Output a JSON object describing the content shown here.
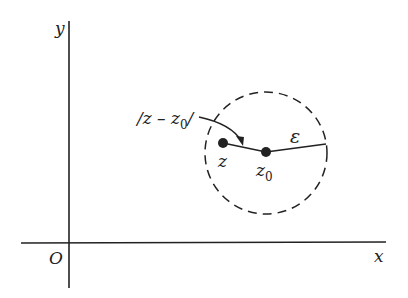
{
  "diagram": {
    "axes": {
      "x_label": "x",
      "y_label": "y",
      "origin_label": "O"
    },
    "points": [
      {
        "id": "z",
        "label": "z"
      },
      {
        "id": "z0",
        "label": "z",
        "subscript": "0"
      }
    ],
    "radius_label": "ε",
    "distance_label": {
      "text": "/z – z",
      "subscript": "0",
      "suffix": "/"
    },
    "colors": {
      "ink": "#222222",
      "background": "#ffffff"
    }
  }
}
